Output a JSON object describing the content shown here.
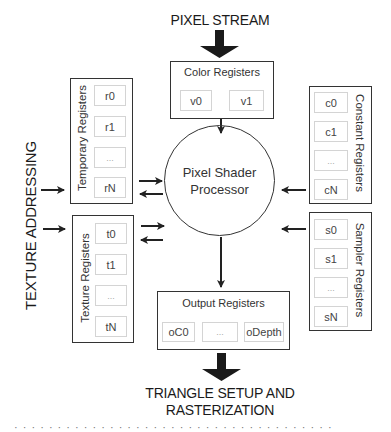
{
  "diagram": {
    "top_label": "PIXEL STREAM",
    "bottom_label_line1": "TRIANGLE SETUP AND",
    "bottom_label_line2": "RASTERIZATION",
    "side_label": "TEXTURE ADDRESSING",
    "processor": {
      "line1": "Pixel Shader",
      "line2": "Processor"
    },
    "color_registers": {
      "title": "Color Registers",
      "cells": [
        "v0",
        "v1"
      ]
    },
    "temporary_registers": {
      "title": "Temporary Registers",
      "cells": [
        "r0",
        "r1",
        "...",
        "rN"
      ]
    },
    "texture_registers": {
      "title": "Texture Registers",
      "cells": [
        "t0",
        "t1",
        "...",
        "tN"
      ]
    },
    "constant_registers": {
      "title": "Constant Registers",
      "cells": [
        "c0",
        "c1",
        "...",
        "cN"
      ]
    },
    "sampler_registers": {
      "title": "Sampler Registers",
      "cells": [
        "s0",
        "s1",
        "...",
        "sN"
      ]
    },
    "output_registers": {
      "title": "Output Registers",
      "cells": [
        "oC0",
        "...",
        "oDepth"
      ]
    },
    "caption_fragment": "· · · · · ·  · · · · · · · · ·  · · · · · ·  · · · · · ·  · · · · · · · · · ·"
  }
}
